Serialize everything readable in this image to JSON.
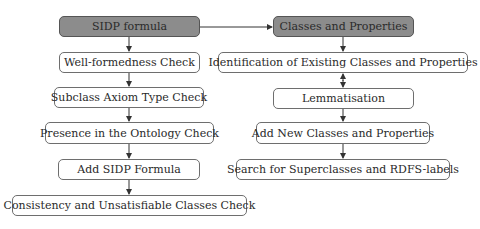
{
  "diagram": {
    "left_column": {
      "header": "SIDP formula",
      "steps": [
        "Well-formedness Check",
        "Subclass Axiom Type Check",
        "Presence in the Ontology Check",
        "Add SIDP Formula",
        "Consistency and Unsatisfiable Classes Check"
      ]
    },
    "right_column": {
      "header": "Classes and Properties",
      "steps": [
        "Identification of Existing Classes and Properties",
        "Lemmatisation",
        "Add New Classes and Properties",
        "Search for Superclasses and RDFS-labels"
      ]
    },
    "colors": {
      "header_fill": "#8c8c8c",
      "box_fill": "#ffffff",
      "border": "#6e6e6e"
    }
  }
}
